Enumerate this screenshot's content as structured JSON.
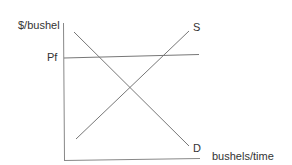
{
  "diagram": {
    "type": "supply-demand",
    "y_axis_label": "$/bushel",
    "x_axis_label": "bushels/time",
    "price_line_label": "Pf",
    "supply_label": "S",
    "demand_label": "D",
    "colors": {
      "axes": "#777777",
      "lines": "#666666",
      "text": "#333333"
    }
  }
}
